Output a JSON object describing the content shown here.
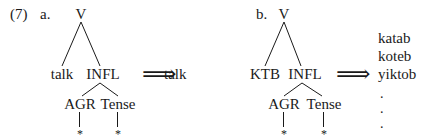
{
  "example": {
    "number": "(7)",
    "part_a": {
      "label": "a.",
      "root": "V",
      "left_child": "talk",
      "right_child": "INFL",
      "infl_children": [
        "AGR",
        "Tense"
      ],
      "leaves": [
        "*",
        "*"
      ],
      "arrow": "⟹",
      "output": "talk"
    },
    "part_b": {
      "label": "b.",
      "root": "V",
      "left_child": "KTB",
      "right_child": "INFL",
      "infl_children": [
        "AGR",
        "Tense"
      ],
      "leaves": [
        "*",
        "*"
      ],
      "arrow": "⟹",
      "outputs": [
        "katab",
        "koteb",
        "yiktob"
      ],
      "continuation": [
        ".",
        ".",
        "."
      ]
    }
  },
  "colors": {
    "ink": "#1a1a1a",
    "background": "#ffffff"
  }
}
